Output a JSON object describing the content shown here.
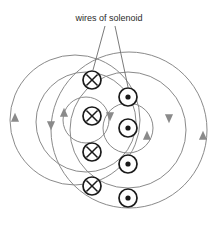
{
  "figure": {
    "caption": {
      "text": "wires of solenoid",
      "x": 109,
      "y": 21,
      "anchor": "middle"
    },
    "colors": {
      "field_line": "#8a8a8a",
      "wire_stroke": "#1a1a1a",
      "leader_line": "#6b6b6b",
      "text": "#2b2b2b",
      "background": "#ffffff"
    },
    "leader_lines": [
      {
        "name": "leader-to-cross-wire",
        "x1": 105,
        "y1": 26,
        "x2": 93,
        "y2": 70
      },
      {
        "name": "leader-to-dot-wire",
        "x1": 115,
        "y1": 26,
        "x2": 128,
        "y2": 87
      }
    ],
    "field_circles": [
      {
        "name": "field-line-outer-left",
        "cx": 75,
        "cy": 120,
        "r": 65
      },
      {
        "name": "field-line-outer-right",
        "cx": 129,
        "cy": 130,
        "r": 78
      },
      {
        "name": "field-line-middle-left",
        "cx": 86,
        "cy": 122,
        "r": 50
      },
      {
        "name": "field-line-middle-right",
        "cx": 128,
        "cy": 130,
        "r": 58
      },
      {
        "name": "field-line-inner-left",
        "cx": 86,
        "cy": 120,
        "r": 23
      },
      {
        "name": "field-line-inner-right",
        "cx": 128,
        "cy": 128,
        "r": 25
      }
    ],
    "arrow_heads": [
      {
        "name": "arrow-outer-left-up",
        "x": 15,
        "y": 118,
        "dir": "up"
      },
      {
        "name": "arrow-outer-right-inner-down",
        "x": 51,
        "y": 125,
        "dir": "down"
      },
      {
        "name": "arrow-outer-right-down",
        "x": 169,
        "y": 118,
        "dir": "down"
      },
      {
        "name": "arrow-far-right-up",
        "x": 203,
        "y": 136,
        "dir": "up"
      },
      {
        "name": "arrow-inner-left-up",
        "x": 64,
        "y": 113,
        "dir": "up"
      },
      {
        "name": "arrow-inner-right-down",
        "x": 110,
        "y": 116,
        "dir": "down"
      },
      {
        "name": "arrow-inner-right-up",
        "x": 147,
        "y": 136,
        "dir": "up"
      }
    ],
    "wires_into_page": {
      "symbol": "cross-in-circle",
      "label": "current into page",
      "x": 92,
      "radius": 9,
      "positions_y": [
        80,
        116,
        152,
        186
      ]
    },
    "wires_out_of_page": {
      "symbol": "dot-in-circle",
      "label": "current out of page",
      "x": 128,
      "radius": 9,
      "dot_radius": 2.6,
      "positions_y": [
        97,
        128,
        164,
        198
      ]
    }
  }
}
